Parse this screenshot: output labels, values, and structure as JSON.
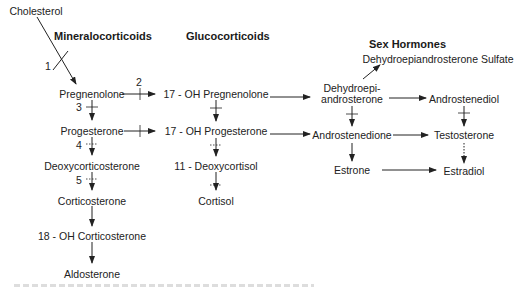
{
  "headers": {
    "mineralocorticoids": "Mineralocorticoids",
    "glucocorticoids": "Glucocorticoids",
    "sex_hormones": "Sex Hormones"
  },
  "nodes": {
    "cholesterol": "Cholesterol",
    "pregnenolone": "Pregnenolone",
    "progesterone": "Progesterone",
    "deoxycorticosterone": "Deoxycorticosterone",
    "corticosterone": "Corticosterone",
    "oh18_corticosterone": "18 - OH Corticosterone",
    "aldosterone": "Aldosterone",
    "oh17_pregnenolone": "17 - OH Pregnenolone",
    "oh17_progesterone": "17 - OH Progesterone",
    "deoxycortisol11": "11 - Deoxycortisol",
    "cortisol": "Cortisol",
    "dhea_line1": "Dehydroepi-",
    "dhea_line2": "androsterone",
    "dhea_sulfate": "Dehydroepiandrosterone Sulfate",
    "androstenediol": "Androstenediol",
    "androstenedione": "Androstenedione",
    "testosterone": "Testosterone",
    "estrone": "Estrone",
    "estradiol": "Estradiol"
  },
  "enzyme_labels": {
    "step1": "1",
    "step2": "2",
    "step3": "3",
    "step4": "4",
    "step5": "5"
  },
  "colors": {
    "ink": "#222222",
    "background": "#ffffff"
  }
}
